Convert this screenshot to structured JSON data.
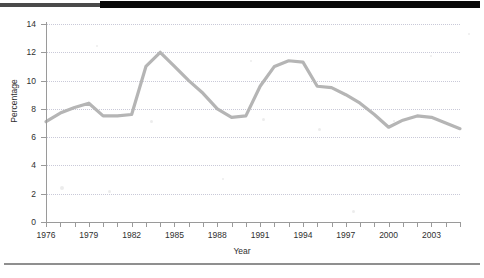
{
  "chart_data": {
    "type": "line",
    "title": "",
    "xlabel": "Year",
    "ylabel": "Percentage",
    "xlim": [
      1976,
      2005
    ],
    "ylim": [
      0,
      14
    ],
    "yticks": [
      0,
      2,
      4,
      6,
      8,
      10,
      12,
      14
    ],
    "xticks": [
      1976,
      1977,
      1978,
      1979,
      1980,
      1981,
      1982,
      1983,
      1984,
      1985,
      1986,
      1987,
      1988,
      1989,
      1990,
      1991,
      1992,
      1993,
      1994,
      1995,
      1996,
      1997,
      1998,
      1999,
      2000,
      2001,
      2002,
      2003,
      2004,
      2005
    ],
    "xtick_labels": [
      "1976",
      "1979",
      "1982",
      "1985",
      "1988",
      "1991",
      "1994",
      "1997",
      "2000",
      "2003"
    ],
    "xtick_labeled_years": [
      1976,
      1979,
      1982,
      1985,
      1988,
      1991,
      1994,
      1997,
      2000,
      2003
    ],
    "grid": true,
    "grid_axis": "y",
    "legend": false,
    "line_color": "#b5b5b5",
    "x": [
      1976,
      1977,
      1978,
      1979,
      1980,
      1981,
      1982,
      1983,
      1984,
      1985,
      1986,
      1987,
      1988,
      1989,
      1990,
      1991,
      1992,
      1993,
      1994,
      1995,
      1996,
      1997,
      1998,
      1999,
      2000,
      2001,
      2002,
      2003,
      2004,
      2005
    ],
    "values": [
      7.1,
      7.7,
      8.1,
      8.4,
      7.5,
      7.5,
      7.6,
      11.0,
      12.0,
      11.0,
      10.0,
      9.1,
      8.0,
      7.4,
      7.5,
      9.6,
      11.0,
      11.4,
      11.3,
      9.6,
      9.5,
      9.0,
      8.4,
      7.6,
      6.7,
      7.2,
      7.5,
      7.4,
      7.0,
      6.6
    ],
    "series": [
      {
        "name": "Percentage",
        "values": [
          7.1,
          7.7,
          8.1,
          8.4,
          7.5,
          7.5,
          7.6,
          11.0,
          12.0,
          11.0,
          10.0,
          9.1,
          8.0,
          7.4,
          7.5,
          9.6,
          11.0,
          11.4,
          11.3,
          9.6,
          9.5,
          9.0,
          8.4,
          7.6,
          6.7,
          7.2,
          7.5,
          7.4,
          7.0,
          6.6
        ]
      }
    ]
  }
}
